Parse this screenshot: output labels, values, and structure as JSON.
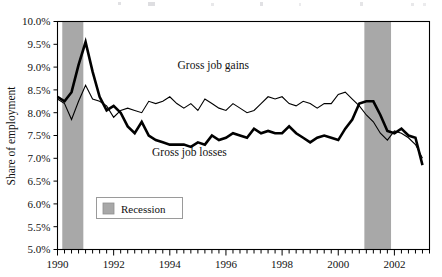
{
  "chart_data": {
    "type": "line",
    "title": "",
    "xlabel": "",
    "ylabel": "Share of employment",
    "xlim": [
      1990.0,
      2003.25
    ],
    "ylim": [
      5.0,
      10.0
    ],
    "ytick_step": 0.5,
    "grid": false,
    "legend_position": "inside-lower-left",
    "x_tick_labels": [
      "1990",
      "1992",
      "1994",
      "1996",
      "1998",
      "2000",
      "2002"
    ],
    "x_tick_values": [
      1990,
      1992,
      1994,
      1996,
      1998,
      2000,
      2002
    ],
    "y_tick_labels": [
      "10.0%",
      "9.5%",
      "9.0%",
      "8.5%",
      "8.0%",
      "7.5%",
      "7.0%",
      "6.5%",
      "6.0%",
      "5.5%",
      "5.0%"
    ],
    "y_tick_values": [
      10.0,
      9.5,
      9.0,
      8.5,
      8.0,
      7.5,
      7.0,
      6.5,
      6.0,
      5.5,
      5.0
    ],
    "minor_tick_interval": 0.25,
    "annotations": [
      {
        "name": "gross-job-gains-label",
        "text": "Gross job gains",
        "x": 1995.55,
        "y": 8.95
      },
      {
        "name": "gross-job-losses-label",
        "text": "Gross job losses",
        "x": 1994.7,
        "y": 7.05
      }
    ],
    "shaded_regions": [
      {
        "name": "recession-1990",
        "label": "Recession",
        "x_start": 1990.17,
        "x_end": 1990.92,
        "color": "#a8a8a8"
      },
      {
        "name": "recession-2001",
        "label": "Recession",
        "x_start": 2000.93,
        "x_end": 2001.88,
        "color": "#a8a8a8"
      }
    ],
    "legend": [
      {
        "name": "legend-recession",
        "label": "Recession",
        "color": "#a8a8a8"
      }
    ],
    "x": [
      1990.0,
      1990.25,
      1990.5,
      1990.75,
      1991.0,
      1991.25,
      1991.5,
      1991.75,
      1992.0,
      1992.25,
      1992.5,
      1992.75,
      1993.0,
      1993.25,
      1993.5,
      1993.75,
      1994.0,
      1994.25,
      1994.5,
      1994.75,
      1995.0,
      1995.25,
      1995.5,
      1995.75,
      1996.0,
      1996.25,
      1996.5,
      1996.75,
      1997.0,
      1997.25,
      1997.5,
      1997.75,
      1998.0,
      1998.25,
      1998.5,
      1998.75,
      1999.0,
      1999.25,
      1999.5,
      1999.75,
      2000.0,
      2000.25,
      2000.5,
      2000.75,
      2001.0,
      2001.25,
      2001.5,
      2001.75,
      2002.0,
      2002.25,
      2002.5,
      2002.75,
      2003.0
    ],
    "series": [
      {
        "name": "Gross job gains",
        "line_weight": "thin",
        "stroke_width": 1.1,
        "color": "#000000",
        "values": [
          8.3,
          8.2,
          7.85,
          8.25,
          8.6,
          8.3,
          8.25,
          8.15,
          7.9,
          8.05,
          8.1,
          8.05,
          8.0,
          8.25,
          8.2,
          8.25,
          8.35,
          8.2,
          8.1,
          8.2,
          8.05,
          8.3,
          8.2,
          8.1,
          8.05,
          8.2,
          8.1,
          8.0,
          8.05,
          8.2,
          8.35,
          8.3,
          8.35,
          8.2,
          8.15,
          8.25,
          8.2,
          8.1,
          8.2,
          8.2,
          8.4,
          8.45,
          8.3,
          8.15,
          7.95,
          7.8,
          7.55,
          7.4,
          7.6,
          7.55,
          7.45,
          7.3,
          7.0
        ]
      },
      {
        "name": "Gross job losses",
        "line_weight": "thick",
        "stroke_width": 2.6,
        "color": "#000000",
        "values": [
          8.35,
          8.25,
          8.45,
          9.05,
          9.55,
          8.9,
          8.35,
          8.05,
          8.15,
          8.0,
          7.7,
          7.55,
          7.8,
          7.5,
          7.4,
          7.35,
          7.3,
          7.3,
          7.3,
          7.25,
          7.35,
          7.3,
          7.5,
          7.4,
          7.45,
          7.55,
          7.5,
          7.45,
          7.65,
          7.55,
          7.6,
          7.55,
          7.55,
          7.7,
          7.55,
          7.45,
          7.35,
          7.45,
          7.5,
          7.45,
          7.4,
          7.65,
          7.85,
          8.2,
          8.25,
          8.25,
          7.95,
          7.6,
          7.55,
          7.65,
          7.5,
          7.45,
          6.85
        ]
      }
    ]
  }
}
